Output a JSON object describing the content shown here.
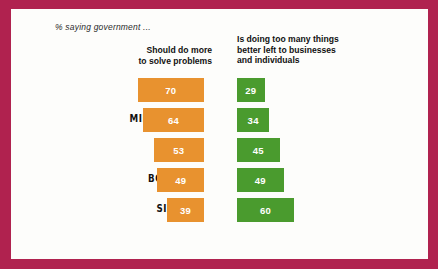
{
  "card": {
    "subtitle": "% saying government ...",
    "border_color": "#b0224f",
    "background_color": "#fdfdfb"
  },
  "chart_data": {
    "type": "bar",
    "title": "% saying government ...",
    "xlabel": "",
    "ylabel": "",
    "orientation": "horizontal-diverging",
    "categories": [
      "GEN Z",
      "MILLENNIAL",
      "GEN X",
      "BOOMER",
      "SILENT"
    ],
    "series": [
      {
        "name": "Should do more to solve problems",
        "color": "#e8922f",
        "side": "left",
        "values": [
          70,
          64,
          53,
          49,
          39
        ]
      },
      {
        "name": "Is doing too many things better left to businesses and individuals",
        "color": "#4a9b2e",
        "side": "right",
        "values": [
          29,
          34,
          45,
          49,
          60
        ]
      }
    ],
    "value_labels": true,
    "grid": false,
    "legend": "column-headers",
    "xlim": [
      0,
      70
    ]
  },
  "headers": {
    "left": "Should do more\nto solve problems",
    "left_line1": "Should do more",
    "left_line2": "to solve problems",
    "right_line1": "Is doing too many things",
    "right_line2": "better left to businesses",
    "right_line3": "and individuals"
  },
  "rows": [
    {
      "category": "GEN Z",
      "left_value": "70",
      "right_value": "29"
    },
    {
      "category": "MILLENNIAL",
      "left_value": "64",
      "right_value": "34"
    },
    {
      "category": "GEN X",
      "left_value": "53",
      "right_value": "45"
    },
    {
      "category": "BOOMER",
      "left_value": "49",
      "right_value": "49"
    },
    {
      "category": "SILENT",
      "left_value": "39",
      "right_value": "60"
    }
  ]
}
